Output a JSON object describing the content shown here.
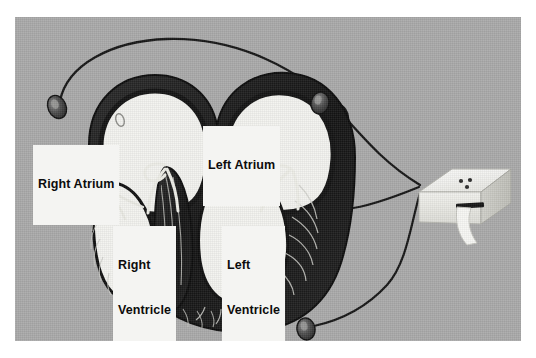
{
  "image": {
    "kind": "photograph",
    "subject": "heart-cross-section-with-ecg-electrodes",
    "background_color": "#a9a9a9",
    "border_color": "#ffffff",
    "ink_color": "#111111",
    "chamber_color": "#f2f2ee",
    "muscle_color": "#1b1b1b"
  },
  "labels": [
    {
      "id": "right-atrium",
      "lines": [
        "Right Atrium"
      ]
    },
    {
      "id": "left-atrium",
      "lines": [
        "Left Atrium"
      ]
    },
    {
      "id": "right-ventricle",
      "lines": [
        "Right",
        "Ventricle"
      ]
    },
    {
      "id": "left-ventricle",
      "lines": [
        "Left",
        "Ventricle"
      ]
    }
  ],
  "label_text": {
    "right_atrium": "Right Atrium",
    "left_atrium": "Left Atrium",
    "right_ventricle_line1": "Right",
    "right_ventricle_line2": "Ventricle",
    "left_ventricle_line1": "Left",
    "left_ventricle_line2": "Ventricle"
  },
  "anatomy": {
    "chambers": [
      {
        "name": "right-atrium",
        "label": "Right Atrium"
      },
      {
        "name": "left-atrium",
        "label": "Left Atrium"
      },
      {
        "name": "right-ventricle",
        "label": "Right Ventricle"
      },
      {
        "name": "left-ventricle",
        "label": "Left Ventricle"
      }
    ],
    "structures": [
      "interventricular-septum",
      "tricuspid-valve-leaflet",
      "mitral-valve-leaflet",
      "myocardial-striations",
      "heart-apex",
      "foramen-ovale-mark"
    ]
  },
  "device": {
    "name": "ecg-recorder",
    "body_color": "#ededea",
    "slot_color": "#1a1a1a",
    "paper_color": "#f6f6f3",
    "indicator_count": 3,
    "indicator_color": "#2a2a2a"
  },
  "electrodes": [
    {
      "id": "electrode-upper-left",
      "position": "upper-left"
    },
    {
      "id": "electrode-upper-right",
      "position": "upper-right"
    },
    {
      "id": "electrode-lower-right",
      "position": "lower-right"
    }
  ],
  "leads": [
    {
      "id": "lead-upper-left-to-device",
      "from": "electrode-upper-left",
      "to": "ecg-recorder"
    },
    {
      "id": "lead-upper-right-to-device",
      "from": "electrode-upper-right",
      "to": "ecg-recorder"
    },
    {
      "id": "lead-lower-right-to-device",
      "from": "electrode-lower-right",
      "to": "ecg-recorder"
    }
  ]
}
